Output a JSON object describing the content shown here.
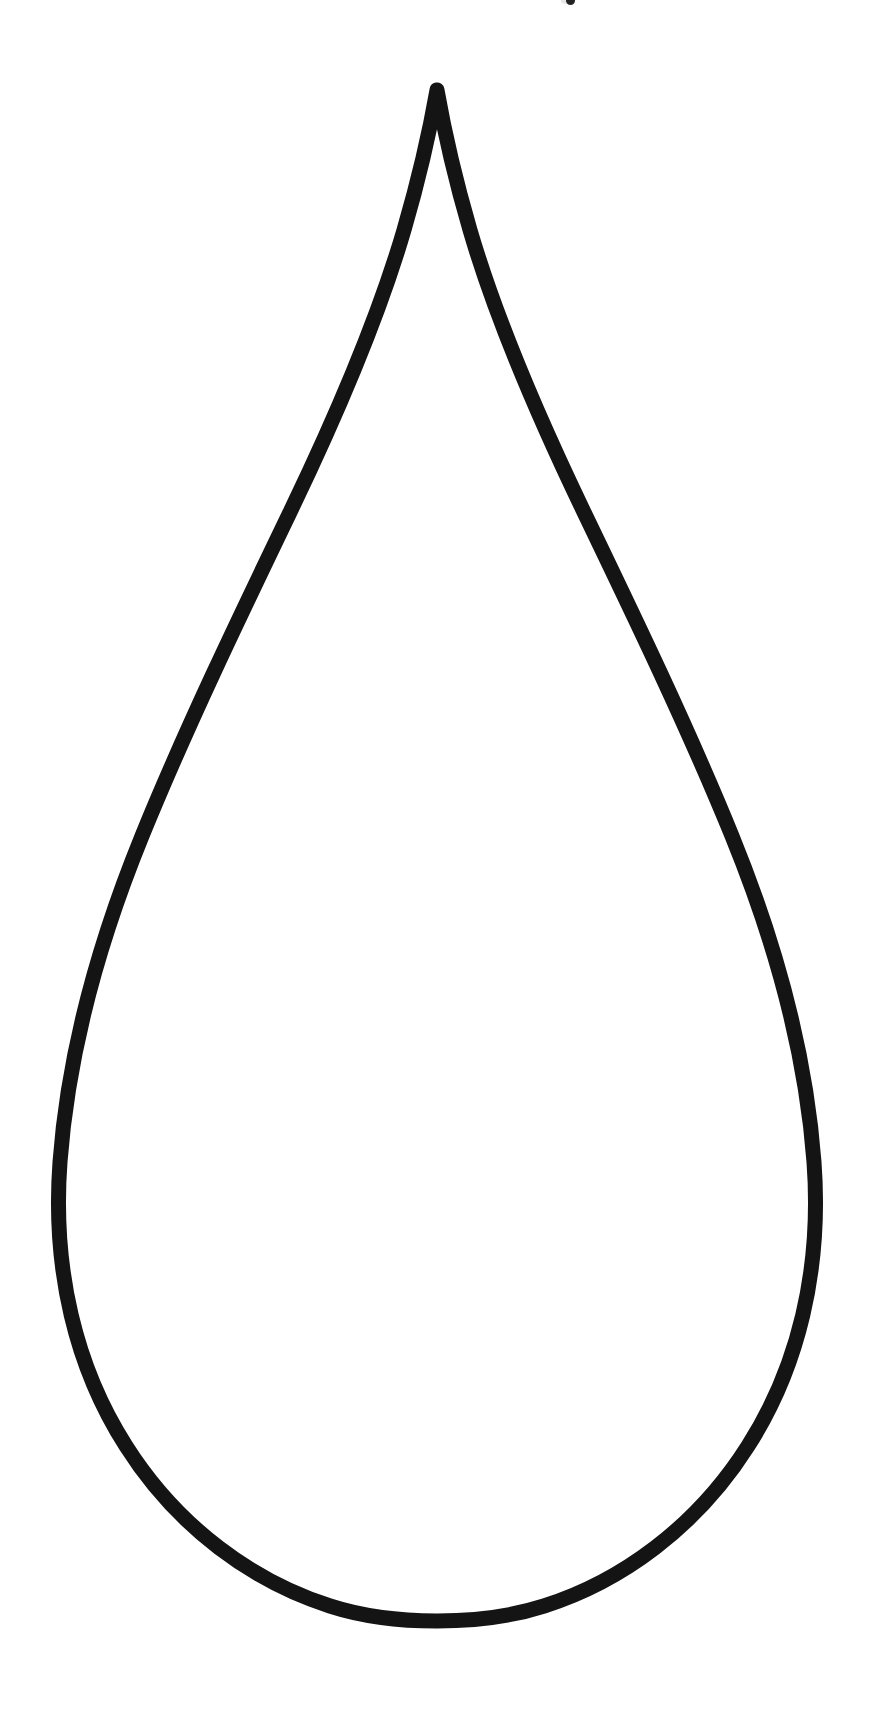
{
  "document": {
    "kind": "coloring-page-outline",
    "title": "Teardrop Outline",
    "canvas": {
      "width": 878,
      "height": 1722,
      "background_color": "#ffffff"
    }
  },
  "artwork": {
    "name": "raindrop-outline",
    "description": "Large empty teardrop / raindrop shape drawn as a single closed black outline on a plain white background",
    "stroke_color": "#141414",
    "fill_color": "none",
    "stroke_width": 15,
    "stroke_linecap": "round",
    "stroke_linejoin": "round",
    "geometry": {
      "apex": {
        "x": 437,
        "y": 90
      },
      "leftmost": {
        "x": 52,
        "y": 1270
      },
      "rightmost": {
        "x": 826,
        "y": 1248
      },
      "bottom": {
        "x": 437,
        "y": 1620
      },
      "path": "M 437 90 C 430 130 420 175 404 230 C 380 312 340 408 292 508 C 240 616 186 728 142 836 C 98 944 68 1054 60 1162 C 52 1270 76 1368 126 1446 C 178 1528 254 1582 330 1606 C 392 1626 482 1626 544 1606 C 620 1582 696 1528 748 1446 C 798 1368 822 1270 814 1162 C 806 1054 776 944 732 836 C 688 728 634 616 582 508 C 534 408 494 312 470 230 C 454 175 444 130 437 90 Z",
      "right_inflection": {
        "x": 487,
        "y": 292
      },
      "left_notch": {
        "x": 196,
        "y": 1520
      }
    }
  },
  "marks": [
    {
      "name": "edge-speck",
      "x": 570,
      "y": 0,
      "color": "#121212",
      "note": "small ink speck clipped by the top edge of the page"
    }
  ]
}
